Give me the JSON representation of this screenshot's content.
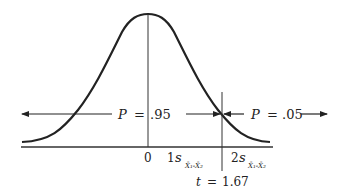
{
  "diagram": {
    "type": "normal-distribution",
    "colors": {
      "ink": "#222222",
      "background": "#ffffff"
    },
    "labels": {
      "p_left_var": "P",
      "p_left_eq": "=",
      "p_left_val": ".95",
      "p_right_var": "P",
      "p_right_eq": "=",
      "p_right_val": ".05",
      "tick_0": "0",
      "tick_1_coef": "1",
      "tick_1_var": "s",
      "tick_1_sub": "X̄₁-X̄₂",
      "tick_2_coef": "2",
      "tick_2_var": "s",
      "tick_2_sub": "X̄₁-X̄₂",
      "t_var": "t",
      "t_eq": "=",
      "t_val": "1.67"
    }
  }
}
